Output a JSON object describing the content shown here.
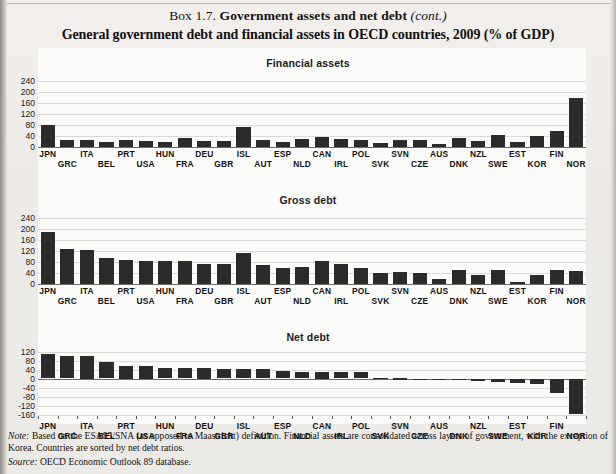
{
  "header": {
    "box_label": "Box 1.7.",
    "box_title": "Government assets and net debt",
    "box_cont": "(cont.)",
    "figure_title": "General government debt and financial assets in OECD countries, 2009 (% of GDP)"
  },
  "footer": {
    "note_label": "Note:",
    "note_text": "Based on the ESA95/SNA (as opposed to Maastricht) definition. Financial assets are consolidated across layers of government, with the exception of Korea. Countries are sorted by net debt ratios.",
    "source_label": "Source:",
    "source_text": "OECD Economic Outlook 89 database."
  },
  "colors": {
    "bar": "#2b2b2b",
    "grid": "#dcd9d6",
    "page": "#efecea",
    "plot_bg": "#fbfbfa"
  },
  "chart_data": [
    {
      "type": "bar",
      "title": "Financial assets",
      "xlabel": "",
      "ylabel": "",
      "ylim": [
        0,
        260
      ],
      "yticks": [
        0,
        40,
        80,
        120,
        160,
        200,
        240
      ],
      "grid": true,
      "legend": "none",
      "categories": [
        "JPN",
        "GRC",
        "ITA",
        "BEL",
        "PRT",
        "USA",
        "HUN",
        "FRA",
        "DEU",
        "GBR",
        "ISL",
        "AUT",
        "ESP",
        "NLD",
        "CAN",
        "IRL",
        "POL",
        "SVK",
        "SVN",
        "CZE",
        "AUS",
        "DNK",
        "NZL",
        "SWE",
        "EST",
        "KOR",
        "FIN",
        "NOR"
      ],
      "values": [
        82,
        25,
        24,
        19,
        25,
        22,
        20,
        33,
        22,
        22,
        73,
        27,
        20,
        28,
        37,
        30,
        24,
        13,
        26,
        24,
        10,
        34,
        23,
        45,
        19,
        41,
        58,
        181
      ]
    },
    {
      "type": "bar",
      "title": "Gross debt",
      "xlabel": "",
      "ylabel": "",
      "ylim": [
        0,
        260
      ],
      "yticks": [
        0,
        40,
        80,
        120,
        160,
        200,
        240
      ],
      "grid": true,
      "legend": "none",
      "categories": [
        "JPN",
        "GRC",
        "ITA",
        "BEL",
        "PRT",
        "USA",
        "HUN",
        "FRA",
        "DEU",
        "GBR",
        "ISL",
        "AUT",
        "ESP",
        "NLD",
        "CAN",
        "IRL",
        "POL",
        "SVK",
        "SVN",
        "CZE",
        "AUS",
        "DNK",
        "NZL",
        "SWE",
        "EST",
        "KOR",
        "FIN",
        "NOR"
      ],
      "values": [
        192,
        130,
        124,
        97,
        88,
        84,
        83,
        86,
        73,
        72,
        112,
        69,
        59,
        61,
        83,
        73,
        58,
        41,
        44,
        41,
        19,
        52,
        34,
        51,
        9,
        33,
        52,
        49
      ]
    },
    {
      "type": "bar",
      "title": "Net debt",
      "xlabel": "",
      "ylabel": "",
      "ylim": [
        -180,
        140
      ],
      "yticks": [
        -160,
        -120,
        -80,
        -40,
        0,
        40,
        80,
        120
      ],
      "grid": true,
      "legend": "none",
      "categories": [
        "JPN",
        "GRC",
        "ITA",
        "BEL",
        "PRT",
        "USA",
        "HUN",
        "FRA",
        "DEU",
        "GBR",
        "ISL",
        "AUT",
        "ESP",
        "NLD",
        "CAN",
        "IRL",
        "POL",
        "SVK",
        "SVN",
        "CZE",
        "AUS",
        "DNK",
        "NZL",
        "SWE",
        "EST",
        "KOR",
        "FIN",
        "NOR"
      ],
      "values": [
        108,
        98,
        100,
        73,
        55,
        55,
        48,
        47,
        45,
        44,
        43,
        41,
        34,
        31,
        30,
        28,
        27,
        3,
        2,
        -4,
        -7,
        -8,
        -9,
        -17,
        -19,
        -25,
        -63,
        -157
      ]
    }
  ]
}
